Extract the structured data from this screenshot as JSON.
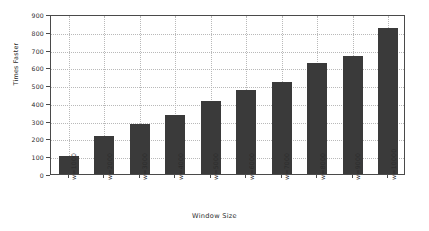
{
  "chart_data": {
    "type": "bar",
    "title": "",
    "subtitle": "",
    "xlabel": "Window Size",
    "ylabel": "Times Faster",
    "categories": [
      "w=1000",
      "w=2000",
      "w=3000",
      "w=4000",
      "w=5000",
      "w=6000",
      "w=7000",
      "w=8000",
      "w=9000",
      "w=10000"
    ],
    "values": [
      102,
      215,
      283,
      334,
      413,
      475,
      515,
      622,
      662,
      820
    ],
    "series": [
      {
        "name": "Times Faster",
        "values": [
          102,
          215,
          283,
          334,
          413,
          475,
          515,
          622,
          662,
          820
        ]
      }
    ],
    "ylim": [
      0,
      900
    ],
    "yticks": [
      0,
      100,
      200,
      300,
      400,
      500,
      600,
      700,
      800,
      900
    ],
    "ytick_labels": [
      "0",
      "100",
      "200",
      "300",
      "400",
      "500",
      "600",
      "700",
      "800",
      "900"
    ],
    "grid": true,
    "grid_axis": "both",
    "legend": false,
    "legend_position": "none",
    "bar_color": "#3a3a3a",
    "grid_color": "#b9b9b9",
    "axis_color": "#4a4a4a",
    "background": "#ffffff",
    "xtick_rotation": -90,
    "annotations": []
  }
}
